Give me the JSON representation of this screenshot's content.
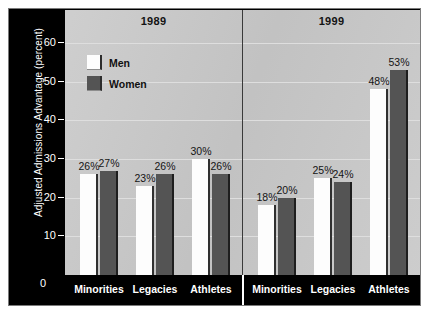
{
  "chart_data": {
    "type": "bar",
    "title": "",
    "xlabel": "",
    "ylabel": "Adjusted Admissions Advantage (percent)",
    "ylim": [
      0,
      60
    ],
    "yticks": [
      0,
      10,
      20,
      30,
      40,
      50,
      60
    ],
    "grid": true,
    "legend_position": "inside upper-left of first panel",
    "value_suffix": "%",
    "panels": [
      {
        "name": "1989",
        "categories": [
          "Minorities",
          "Legacies",
          "Athletes"
        ],
        "series": [
          {
            "name": "Men",
            "values": [
              26,
              23,
              30
            ],
            "labels": [
              "26%",
              "23%",
              "30%"
            ]
          },
          {
            "name": "Women",
            "values": [
              27,
              26,
              26
            ],
            "labels": [
              "27%",
              "26%",
              "26%"
            ]
          }
        ]
      },
      {
        "name": "1999",
        "categories": [
          "Minorities",
          "Legacies",
          "Athletes"
        ],
        "series": [
          {
            "name": "Men",
            "values": [
              18,
              25,
              48
            ],
            "labels": [
              "18%",
              "25%",
              "48%"
            ]
          },
          {
            "name": "Women",
            "values": [
              20,
              24,
              53
            ],
            "labels": [
              "20%",
              "24%",
              "53%"
            ]
          }
        ]
      }
    ],
    "legend": [
      {
        "label": "Men",
        "color": "#fdfdfd"
      },
      {
        "label": "Women",
        "color": "#545454"
      }
    ],
    "colors": {
      "plot_background": "#c9c9c9",
      "gridline": "#dedede",
      "axis_band": "#000000",
      "axis_text": "#ffffff",
      "men_bar": "#fdfdfd",
      "women_bar": "#545454",
      "value_text": "#141414"
    }
  },
  "axis": {
    "y_title": "Adjusted Admissions Advantage (percent)",
    "ticks": [
      "60",
      "50",
      "40",
      "30",
      "20",
      "10",
      "0"
    ]
  }
}
